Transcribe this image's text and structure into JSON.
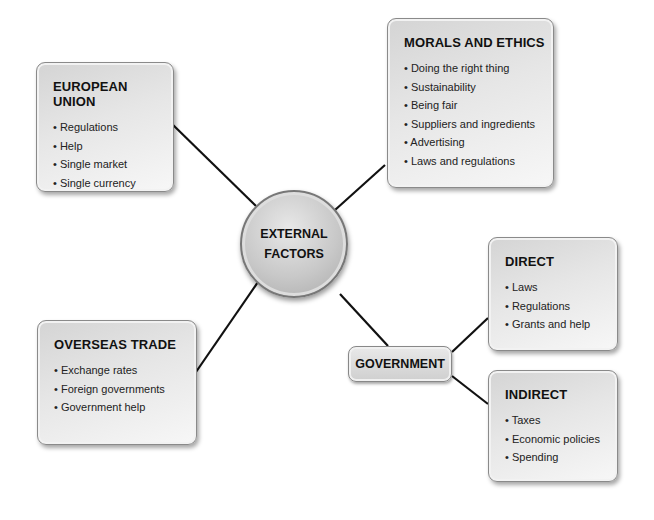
{
  "center": {
    "line1": "EXTERNAL",
    "line2": "FACTORS"
  },
  "european_union": {
    "title": "EUROPEAN UNION",
    "items": [
      "Regulations",
      "Help",
      "Single market",
      "Single currency"
    ]
  },
  "morals_ethics": {
    "title": "MORALS AND ETHICS",
    "items": [
      "Doing the right thing",
      "Sustainability",
      "Being fair",
      "Suppliers and ingredients",
      "Advertising",
      "Laws and regulations"
    ]
  },
  "overseas_trade": {
    "title": "OVERSEAS TRADE",
    "items": [
      "Exchange rates",
      "Foreign governments",
      "Government help"
    ]
  },
  "government": {
    "title": "GOVERNMENT"
  },
  "direct": {
    "title": "DIRECT",
    "items": [
      "Laws",
      "Regulations",
      "Grants and help"
    ]
  },
  "indirect": {
    "title": "INDIRECT",
    "items": [
      "Taxes",
      "Economic policies",
      "Spending"
    ]
  }
}
